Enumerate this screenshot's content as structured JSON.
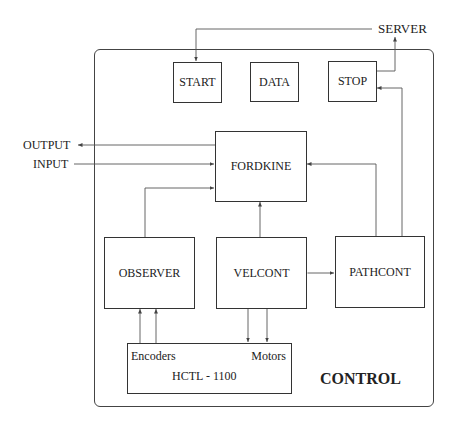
{
  "diagram": {
    "container_label": "CONTROL",
    "external": {
      "server": "SERVER",
      "output": "OUTPUT",
      "input": "INPUT"
    },
    "blocks": {
      "start": "START",
      "data": "DATA",
      "stop": "STOP",
      "fordkine": "FORDKINE",
      "observer": "OBSERVER",
      "velcont": "VELCONT",
      "pathcont": "PATHCONT",
      "hctl": {
        "title": "HCTL - 1100",
        "left_port": "Encoders",
        "right_port": "Motors"
      }
    },
    "connections": [
      {
        "from": "SERVER",
        "to": "START"
      },
      {
        "from": "STOP",
        "to": "SERVER"
      },
      {
        "from": "PATHCONT",
        "to": "STOP"
      },
      {
        "from": "FORDKINE",
        "to": "OUTPUT"
      },
      {
        "from": "INPUT",
        "to": "FORDKINE"
      },
      {
        "from": "OBSERVER",
        "to": "FORDKINE"
      },
      {
        "from": "VELCONT",
        "to": "FORDKINE"
      },
      {
        "from": "PATHCONT",
        "to": "FORDKINE"
      },
      {
        "from": "VELCONT",
        "to": "PATHCONT",
        "bidirectional": true
      },
      {
        "from": "HCTL - 1100 Encoders",
        "to": "OBSERVER",
        "count": 2
      },
      {
        "from": "VELCONT",
        "to": "HCTL - 1100 Motors",
        "count": 2
      }
    ]
  }
}
